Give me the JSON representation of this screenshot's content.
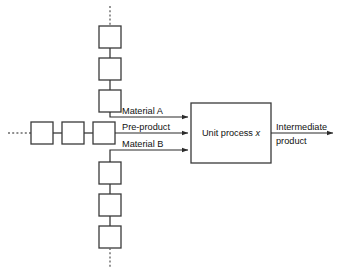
{
  "diagram": {
    "process": {
      "label_prefix": "Unit process ",
      "label_variable": "x"
    },
    "inputs": [
      {
        "id": "material-a",
        "label": "Material A"
      },
      {
        "id": "pre-product",
        "label": "Pre-product"
      },
      {
        "id": "material-b",
        "label": "Material B"
      }
    ],
    "outputs": [
      {
        "id": "intermediate-product",
        "label_line1": "Intermediate",
        "label_line2": "product"
      }
    ],
    "chains": {
      "upper": {
        "box_count": 3,
        "continuation": "dashed"
      },
      "left": {
        "box_count": 3,
        "continuation": "dashed"
      },
      "lower": {
        "box_count": 3,
        "continuation": "dashed"
      }
    },
    "colors": {
      "stroke": "#3a3a3a",
      "flow": "#2b2b2b",
      "dashed": "#6a6a6a",
      "background": "#ffffff",
      "text": "#111111"
    }
  }
}
